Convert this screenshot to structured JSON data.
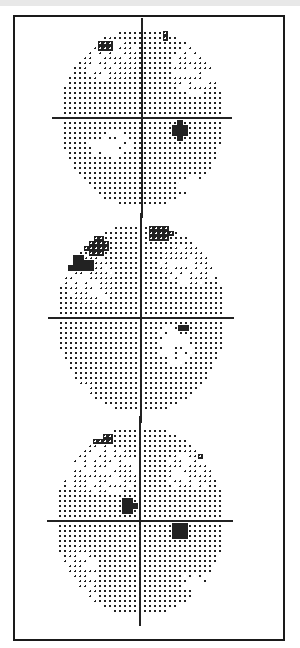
{
  "page": {
    "background": "#ffffff",
    "frame_color": "#1a1a1a",
    "ink_color": "#222222"
  },
  "chart_data": [
    {
      "type": "heatmap",
      "title": "",
      "description": "Visual field grayscale plot 1 (top)",
      "center": [
        142,
        118
      ],
      "radius_x": 82,
      "radius_y": 90,
      "spacing": 5,
      "grid": true,
      "defects": [
        {
          "x": 105,
          "y": 45,
          "rx": 9,
          "ry": 5,
          "level": "hatch"
        },
        {
          "x": 165,
          "y": 35,
          "rx": 5,
          "ry": 4,
          "level": "hatch"
        },
        {
          "x": 180,
          "y": 130,
          "rx": 8,
          "ry": 8,
          "level": "solid"
        },
        {
          "x": 110,
          "y": 60,
          "rx": 30,
          "ry": 22,
          "level": "light"
        },
        {
          "x": 195,
          "y": 70,
          "rx": 25,
          "ry": 25,
          "level": "light"
        },
        {
          "x": 110,
          "y": 145,
          "rx": 22,
          "ry": 14,
          "level": "sparse"
        },
        {
          "x": 190,
          "y": 185,
          "rx": 12,
          "ry": 8,
          "level": "sparse"
        }
      ]
    },
    {
      "type": "heatmap",
      "title": "",
      "description": "Visual field grayscale plot 2 (middle)",
      "center": [
        141,
        318
      ],
      "radius_x": 85,
      "radius_y": 95,
      "spacing": 5,
      "grid": true,
      "defects": [
        {
          "x": 75,
          "y": 265,
          "rx": 20,
          "ry": 8,
          "level": "solid"
        },
        {
          "x": 95,
          "y": 245,
          "rx": 12,
          "ry": 10,
          "level": "hatch"
        },
        {
          "x": 160,
          "y": 232,
          "rx": 13,
          "ry": 9,
          "level": "hatch"
        },
        {
          "x": 184,
          "y": 328,
          "rx": 5,
          "ry": 5,
          "level": "solid"
        },
        {
          "x": 90,
          "y": 280,
          "rx": 25,
          "ry": 25,
          "level": "light"
        },
        {
          "x": 190,
          "y": 265,
          "rx": 30,
          "ry": 20,
          "level": "light"
        },
        {
          "x": 175,
          "y": 345,
          "rx": 18,
          "ry": 20,
          "level": "sparse"
        },
        {
          "x": 85,
          "y": 388,
          "rx": 8,
          "ry": 10,
          "level": "light"
        }
      ]
    },
    {
      "type": "heatmap",
      "title": "",
      "description": "Visual field grayscale plot 3 (bottom)",
      "center": [
        140,
        521
      ],
      "radius_x": 85,
      "radius_y": 95,
      "spacing": 5,
      "grid": true,
      "defects": [
        {
          "x": 100,
          "y": 438,
          "rx": 14,
          "ry": 5,
          "level": "hatch"
        },
        {
          "x": 202,
          "y": 453,
          "rx": 4,
          "ry": 4,
          "level": "hatch"
        },
        {
          "x": 128,
          "y": 507,
          "rx": 8,
          "ry": 8,
          "level": "solid"
        },
        {
          "x": 180,
          "y": 532,
          "rx": 9,
          "ry": 8,
          "level": "solid"
        },
        {
          "x": 100,
          "y": 470,
          "rx": 40,
          "ry": 25,
          "level": "light"
        },
        {
          "x": 190,
          "y": 470,
          "rx": 25,
          "ry": 20,
          "level": "light"
        },
        {
          "x": 80,
          "y": 580,
          "rx": 20,
          "ry": 35,
          "level": "light"
        },
        {
          "x": 195,
          "y": 580,
          "rx": 12,
          "ry": 12,
          "level": "sparse"
        }
      ]
    }
  ]
}
